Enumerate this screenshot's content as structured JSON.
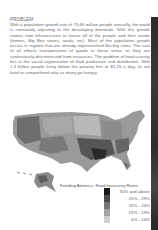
{
  "document": {
    "heading": "PROBLEM",
    "body": "With a population growth rate of 75-80 million people annually, the world is constantly adjusting to the developing demands. With this growth comes new infrastructure to house all of the people and their needs (homes, Big Box stores, roads, etc). Most of the population growth occurs in regions that are already impoverished like big cities. The cost of oil effects transportation of goods to these areas so they are continuously disconnected from resources. The problem of food scarcity lies in the social organization of food production and distribution. With 1.4 billion people living below the poverty line or $1.25 a day, its not hard to comprehend why so many go hungry."
  },
  "map": {
    "title": "Feeding America: Food Insecurity Rates",
    "legend": [
      {
        "label": "30% and above",
        "color": "#1a1a1a"
      },
      {
        "label": "25% - 29%",
        "color": "#4a4a4a"
      },
      {
        "label": "20% - 24%",
        "color": "#777777"
      },
      {
        "label": "15% - 19%",
        "color": "#a3a3a3"
      },
      {
        "label": "4% - 14%",
        "color": "#cfcfcf"
      }
    ]
  }
}
